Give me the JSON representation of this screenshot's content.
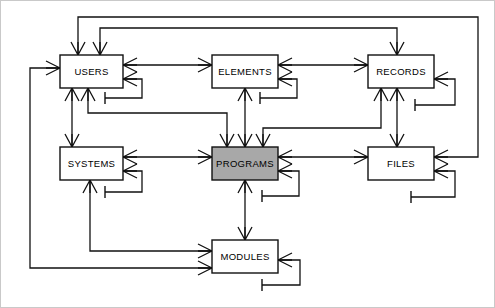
{
  "diagram": {
    "type": "entity-relationship",
    "notation": "crows-foot",
    "background_color": "#ffffff",
    "line_color": "#111111",
    "frame_color": "#c9c9c9",
    "entities": [
      {
        "id": "users",
        "label": "USERS",
        "x": 60,
        "y": 55,
        "w": 63,
        "h": 33,
        "fill": "#ffffff",
        "highlighted": false
      },
      {
        "id": "elements",
        "label": "ELEMENTS",
        "x": 212,
        "y": 55,
        "w": 66,
        "h": 33,
        "fill": "#ffffff",
        "highlighted": false
      },
      {
        "id": "records",
        "label": "RECORDS",
        "x": 368,
        "y": 55,
        "w": 66,
        "h": 33,
        "fill": "#ffffff",
        "highlighted": false
      },
      {
        "id": "systems",
        "label": "SYSTEMS",
        "x": 60,
        "y": 147,
        "w": 63,
        "h": 33,
        "fill": "#ffffff",
        "highlighted": false
      },
      {
        "id": "programs",
        "label": "PROGRAMS",
        "x": 212,
        "y": 147,
        "w": 66,
        "h": 33,
        "fill": "#a8a8a8",
        "highlighted": true
      },
      {
        "id": "files",
        "label": "FILES",
        "x": 368,
        "y": 147,
        "w": 66,
        "h": 33,
        "fill": "#ffffff",
        "highlighted": false
      },
      {
        "id": "modules",
        "label": "MODULES",
        "x": 212,
        "y": 240,
        "w": 66,
        "h": 33,
        "fill": "#ffffff",
        "highlighted": false
      }
    ],
    "relationships": [
      {
        "from": "users",
        "to": "elements",
        "kind": "many-to-many"
      },
      {
        "from": "elements",
        "to": "records",
        "kind": "many-to-many"
      },
      {
        "from": "users",
        "to": "systems",
        "kind": "one-to-many"
      },
      {
        "from": "users",
        "to": "programs",
        "kind": "one-to-many"
      },
      {
        "from": "elements",
        "to": "programs",
        "kind": "one-to-many"
      },
      {
        "from": "records",
        "to": "programs",
        "kind": "one-to-many"
      },
      {
        "from": "records",
        "to": "files",
        "kind": "one-to-many"
      },
      {
        "from": "systems",
        "to": "programs",
        "kind": "many-to-many"
      },
      {
        "from": "programs",
        "to": "files",
        "kind": "many-to-many"
      },
      {
        "from": "programs",
        "to": "modules",
        "kind": "one-to-many"
      },
      {
        "from": "systems",
        "to": "modules",
        "kind": "one-to-many"
      },
      {
        "from": "files",
        "to": "users",
        "kind": "many-to-many"
      },
      {
        "from": "records",
        "to": "users",
        "kind": "many-to-many"
      },
      {
        "from": "modules",
        "to": "users",
        "kind": "many-to-many"
      },
      {
        "from": "users",
        "to": "users",
        "kind": "recursive"
      },
      {
        "from": "elements",
        "to": "elements",
        "kind": "recursive"
      },
      {
        "from": "records",
        "to": "records",
        "kind": "recursive"
      },
      {
        "from": "systems",
        "to": "systems",
        "kind": "recursive"
      },
      {
        "from": "programs",
        "to": "programs",
        "kind": "recursive"
      },
      {
        "from": "files",
        "to": "files",
        "kind": "recursive"
      },
      {
        "from": "modules",
        "to": "modules",
        "kind": "recursive"
      }
    ]
  }
}
